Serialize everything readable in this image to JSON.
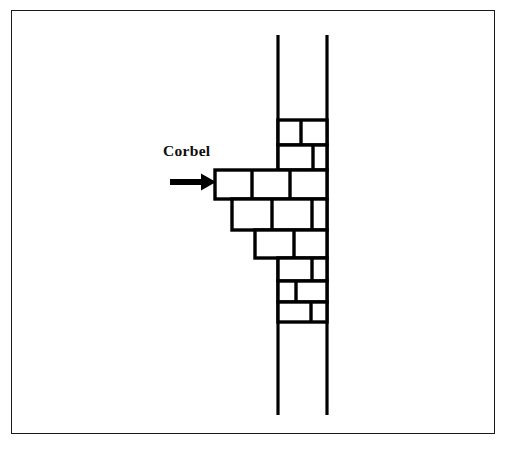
{
  "figure": {
    "background_color": "#ffffff",
    "ink_color": "#000000",
    "border": {
      "present": true,
      "color": "#1a1a1a",
      "thickness_px": 1.6
    }
  },
  "annotation": {
    "label": "Corbel",
    "label_color": "#0d0d0d",
    "arrow": {
      "name": "arrow-right",
      "direction": "right",
      "color": "#000000",
      "start_x": 170,
      "end_x": 216,
      "y": 182
    }
  },
  "diagram": {
    "wall_line_left_x": 278,
    "wall_line_right_x": 327,
    "wall_line_top_y": 35,
    "wall_line_bottom_y": 415,
    "masonry_top_y": 120,
    "masonry_bottom_y": 322,
    "stroke_width_wall": 3.2,
    "stroke_width_stone": 3.4,
    "courses": [
      {
        "name": "course-1-top",
        "y_top": 120,
        "y_bottom": 145,
        "x_left": 278,
        "x_right": 327,
        "joints_x": [
          301
        ]
      },
      {
        "name": "course-2",
        "y_top": 145,
        "y_bottom": 170,
        "x_left": 278,
        "x_right": 327,
        "joints_x": [
          313
        ]
      },
      {
        "name": "course-3-corbel",
        "y_top": 170,
        "y_bottom": 199,
        "x_left": 215,
        "x_right": 327,
        "joints_x": [
          252,
          290
        ]
      },
      {
        "name": "course-4",
        "y_top": 199,
        "y_bottom": 230,
        "x_left": 232,
        "x_right": 327,
        "joints_x": [
          272,
          312
        ]
      },
      {
        "name": "course-5",
        "y_top": 230,
        "y_bottom": 258,
        "x_left": 255,
        "x_right": 327,
        "joints_x": [
          294
        ]
      },
      {
        "name": "course-6",
        "y_top": 258,
        "y_bottom": 281,
        "x_left": 278,
        "x_right": 327,
        "joints_x": [
          312
        ]
      },
      {
        "name": "course-7",
        "y_top": 281,
        "y_bottom": 302,
        "x_left": 278,
        "x_right": 327,
        "joints_x": [
          296
        ]
      },
      {
        "name": "course-8-bottom",
        "y_top": 302,
        "y_bottom": 322,
        "x_left": 278,
        "x_right": 327,
        "joints_x": [
          311
        ]
      }
    ]
  }
}
